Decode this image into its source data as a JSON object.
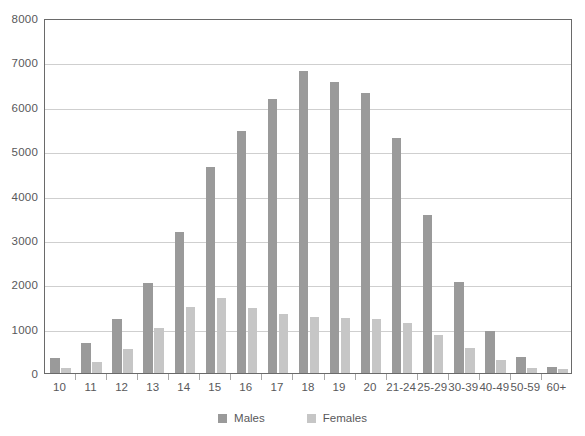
{
  "chart_data": {
    "type": "bar",
    "title": "",
    "subtitle": "",
    "xlabel": "",
    "ylabel": "",
    "ylim": [
      0,
      8000
    ],
    "yticks": [
      0,
      1000,
      2000,
      3000,
      4000,
      5000,
      6000,
      7000,
      8000
    ],
    "ytick_labels": [
      "0",
      "1000",
      "2000",
      "3000",
      "4000",
      "5000",
      "6000",
      "7000",
      "8000"
    ],
    "grid": "horizontal",
    "legend_position": "bottom-center",
    "categories": [
      "10",
      "11",
      "12",
      "13",
      "14",
      "15",
      "16",
      "17",
      "18",
      "19",
      "20",
      "21-24",
      "25-29",
      "30-39",
      "40-49",
      "50-59",
      "60+"
    ],
    "series": [
      {
        "name": "Males",
        "color": "#9a9a9a",
        "values": [
          340,
          670,
          1220,
          2030,
          3170,
          4640,
          5450,
          6170,
          6800,
          6550,
          6300,
          5290,
          3550,
          2060,
          950,
          350,
          130
        ]
      },
      {
        "name": "Females",
        "color": "#c6c6c6",
        "values": [
          120,
          250,
          550,
          1020,
          1490,
          1680,
          1460,
          1330,
          1260,
          1240,
          1210,
          1120,
          850,
          560,
          290,
          110,
          90
        ]
      }
    ],
    "legend": [
      "Males",
      "Females"
    ]
  },
  "axes": {
    "y_tick_labels": [
      "8000",
      "7000",
      "6000",
      "5000",
      "4000",
      "3000",
      "2000",
      "1000",
      "0"
    ],
    "x_tick_labels": [
      "10",
      "11",
      "12",
      "13",
      "14",
      "15",
      "16",
      "17",
      "18",
      "19",
      "20",
      "21-24",
      "25-29",
      "30-39",
      "40-49",
      "50-59",
      "60+"
    ]
  },
  "legend": {
    "entries": [
      {
        "label": "Males",
        "color": "#9a9a9a"
      },
      {
        "label": "Females",
        "color": "#c6c6c6"
      }
    ]
  },
  "colors": {
    "male_bar": "#9a9a9a",
    "female_bar": "#c6c6c6",
    "gridline": "#cfcfcf",
    "axis_frame": "#6a6a6a",
    "text": "#58585a",
    "background": "#ffffff"
  }
}
